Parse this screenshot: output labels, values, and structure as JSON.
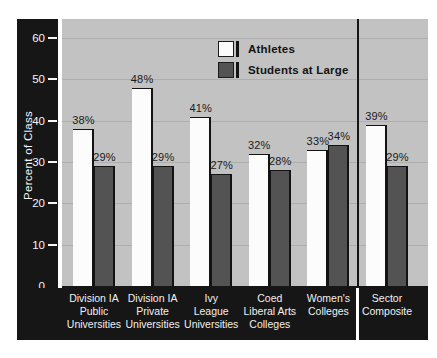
{
  "chart_data": {
    "type": "bar",
    "ylabel": "Percent of Class",
    "ylim": [
      0,
      60
    ],
    "yticks": [
      0,
      10,
      20,
      30,
      40,
      50,
      60
    ],
    "grid": true,
    "legend_position": "top-center",
    "value_label_suffix": "%",
    "categories": [
      "Division IA\nPublic\nUniversities",
      "Division IA\nPrivate\nUniversities",
      "Ivy\nLeague\nUniversities",
      "Coed\nLiberal Arts\nColleges",
      "Women's\nColleges",
      "Sector\nComposite"
    ],
    "series": [
      {
        "name": "Athletes",
        "color": "#fcfcfc",
        "values": [
          38,
          48,
          41,
          32,
          33,
          39
        ]
      },
      {
        "name": "Students at Large",
        "color": "#535353",
        "values": [
          29,
          29,
          27,
          28,
          34,
          29
        ]
      }
    ],
    "separator_after_category_index": 4
  },
  "colors": {
    "frame": "#161616",
    "plot_background": "#c2c2c2",
    "gridline": "#aeaeae",
    "bar_outline": "#131313",
    "text_on_frame": "#f5f5f5",
    "value_label_text": "#1a1a1a"
  }
}
